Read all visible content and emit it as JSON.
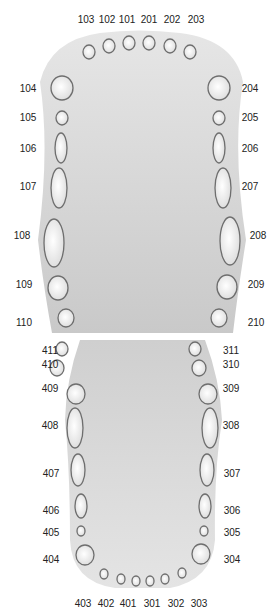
{
  "diagram": {
    "title": "",
    "colors": {
      "jaw_fill_top": "#e6e6e6",
      "jaw_fill_bottom": "#c9c9c9",
      "tooth_outline": "#6e6e6e",
      "tooth_fill_center": "#ffffff",
      "tooth_fill_edge": "#dcdcdc",
      "label": "#222222"
    },
    "upper_jaw": {
      "name": "maxillary arch",
      "teeth": [
        {
          "id": "103",
          "cx": 89,
          "cy": 52,
          "rx": 6,
          "ry": 7,
          "lx": 86,
          "ly": 20
        },
        {
          "id": "102",
          "cx": 109,
          "cy": 46,
          "rx": 6,
          "ry": 7,
          "lx": 107,
          "ly": 20
        },
        {
          "id": "101",
          "cx": 129,
          "cy": 43,
          "rx": 6,
          "ry": 7,
          "lx": 127,
          "ly": 20
        },
        {
          "id": "201",
          "cx": 149,
          "cy": 43,
          "rx": 6,
          "ry": 7,
          "lx": 149,
          "ly": 20
        },
        {
          "id": "202",
          "cx": 170,
          "cy": 46,
          "rx": 6,
          "ry": 7,
          "lx": 172,
          "ly": 20
        },
        {
          "id": "203",
          "cx": 190,
          "cy": 52,
          "rx": 6,
          "ry": 7,
          "lx": 196,
          "ly": 20
        },
        {
          "id": "104",
          "cx": 62,
          "cy": 88,
          "rx": 11,
          "ry": 12,
          "lx": 28,
          "ly": 89
        },
        {
          "id": "105",
          "cx": 62,
          "cy": 118,
          "rx": 6,
          "ry": 7,
          "lx": 28,
          "ly": 118
        },
        {
          "id": "106",
          "cx": 61,
          "cy": 148,
          "rx": 6,
          "ry": 15,
          "lx": 28,
          "ly": 149
        },
        {
          "id": "107",
          "cx": 59,
          "cy": 188,
          "rx": 8,
          "ry": 20,
          "lx": 28,
          "ly": 187
        },
        {
          "id": "108",
          "cx": 54,
          "cy": 243,
          "rx": 10,
          "ry": 24,
          "lx": 22,
          "ly": 236
        },
        {
          "id": "109",
          "cx": 58,
          "cy": 288,
          "rx": 10,
          "ry": 12,
          "lx": 24,
          "ly": 285
        },
        {
          "id": "110",
          "cx": 66,
          "cy": 318,
          "rx": 8,
          "ry": 9,
          "lx": 24,
          "ly": 323
        },
        {
          "id": "204",
          "cx": 219,
          "cy": 88,
          "rx": 11,
          "ry": 12,
          "lx": 250,
          "ly": 89
        },
        {
          "id": "205",
          "cx": 219,
          "cy": 118,
          "rx": 6,
          "ry": 7,
          "lx": 250,
          "ly": 118
        },
        {
          "id": "206",
          "cx": 219,
          "cy": 148,
          "rx": 6,
          "ry": 15,
          "lx": 250,
          "ly": 149
        },
        {
          "id": "207",
          "cx": 223,
          "cy": 188,
          "rx": 8,
          "ry": 20,
          "lx": 250,
          "ly": 187
        },
        {
          "id": "208",
          "cx": 230,
          "cy": 241,
          "rx": 10,
          "ry": 24,
          "lx": 258,
          "ly": 236
        },
        {
          "id": "209",
          "cx": 227,
          "cy": 287,
          "rx": 10,
          "ry": 12,
          "lx": 256,
          "ly": 285
        },
        {
          "id": "210",
          "cx": 219,
          "cy": 318,
          "rx": 8,
          "ry": 9,
          "lx": 256,
          "ly": 323
        }
      ]
    },
    "lower_jaw": {
      "name": "mandibular arch",
      "teeth": [
        {
          "id": "411",
          "cx": 62,
          "cy": 349,
          "rx": 6,
          "ry": 7,
          "lx": 50,
          "ly": 351
        },
        {
          "id": "410",
          "cx": 57,
          "cy": 368,
          "rx": 7,
          "ry": 8,
          "lx": 50,
          "ly": 365
        },
        {
          "id": "409",
          "cx": 76,
          "cy": 394,
          "rx": 9,
          "ry": 10,
          "lx": 50,
          "ly": 389
        },
        {
          "id": "408",
          "cx": 75,
          "cy": 428,
          "rx": 8,
          "ry": 20,
          "lx": 50,
          "ly": 426
        },
        {
          "id": "407",
          "cx": 78,
          "cy": 470,
          "rx": 7,
          "ry": 16,
          "lx": 51,
          "ly": 474
        },
        {
          "id": "406",
          "cx": 81,
          "cy": 506,
          "rx": 6,
          "ry": 12,
          "lx": 51,
          "ly": 511
        },
        {
          "id": "405",
          "cx": 81,
          "cy": 531,
          "rx": 4,
          "ry": 5,
          "lx": 51,
          "ly": 533
        },
        {
          "id": "404",
          "cx": 85,
          "cy": 555,
          "rx": 9,
          "ry": 10,
          "lx": 51,
          "ly": 560
        },
        {
          "id": "403",
          "cx": 104,
          "cy": 574,
          "rx": 4,
          "ry": 5,
          "lx": 83,
          "ly": 604
        },
        {
          "id": "402",
          "cx": 121,
          "cy": 579,
          "rx": 4,
          "ry": 5,
          "lx": 106,
          "ly": 604
        },
        {
          "id": "401",
          "cx": 136,
          "cy": 581,
          "rx": 4,
          "ry": 5,
          "lx": 128,
          "ly": 604
        },
        {
          "id": "301",
          "cx": 150,
          "cy": 581,
          "rx": 4,
          "ry": 5,
          "lx": 152,
          "ly": 604
        },
        {
          "id": "302",
          "cx": 165,
          "cy": 579,
          "rx": 4,
          "ry": 5,
          "lx": 176,
          "ly": 604
        },
        {
          "id": "303",
          "cx": 182,
          "cy": 573,
          "rx": 4,
          "ry": 5,
          "lx": 199,
          "ly": 604
        },
        {
          "id": "311",
          "cx": 195,
          "cy": 349,
          "rx": 6,
          "ry": 7,
          "lx": 231,
          "ly": 351
        },
        {
          "id": "310",
          "cx": 199,
          "cy": 368,
          "rx": 7,
          "ry": 8,
          "lx": 231,
          "ly": 365
        },
        {
          "id": "309",
          "cx": 208,
          "cy": 394,
          "rx": 9,
          "ry": 10,
          "lx": 231,
          "ly": 389
        },
        {
          "id": "308",
          "cx": 210,
          "cy": 428,
          "rx": 8,
          "ry": 20,
          "lx": 231,
          "ly": 426
        },
        {
          "id": "307",
          "cx": 207,
          "cy": 470,
          "rx": 7,
          "ry": 16,
          "lx": 232,
          "ly": 474
        },
        {
          "id": "306",
          "cx": 205,
          "cy": 506,
          "rx": 6,
          "ry": 12,
          "lx": 232,
          "ly": 511
        },
        {
          "id": "305",
          "cx": 204,
          "cy": 531,
          "rx": 4,
          "ry": 5,
          "lx": 232,
          "ly": 533
        },
        {
          "id": "304",
          "cx": 201,
          "cy": 554,
          "rx": 9,
          "ry": 10,
          "lx": 232,
          "ly": 560
        }
      ]
    }
  }
}
